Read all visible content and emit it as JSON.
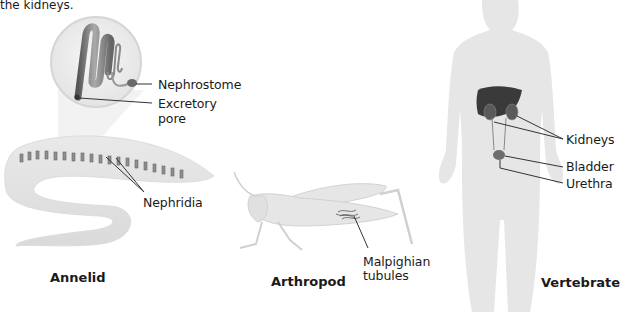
{
  "intro_text": "the kidneys.",
  "panels": {
    "annelid": {
      "caption": "Annelid",
      "labels": {
        "nephrostome": "Nephrostome",
        "excretory_pore_line1": "Excretory",
        "excretory_pore_line2": "pore",
        "nephridia": "Nephridia"
      }
    },
    "arthropod": {
      "caption": "Arthropod",
      "labels": {
        "malpighian_line1": "Malpighian",
        "malpighian_line2": "tubules"
      }
    },
    "vertebrate": {
      "caption": "Vertebrate",
      "labels": {
        "kidneys": "Kidneys",
        "bladder": "Bladder",
        "urethra": "Urethra"
      }
    }
  },
  "colors": {
    "body_fill": "#e6e6e6",
    "organ_dark": "#3a3a3a",
    "organ_mid": "#6e6e6e",
    "leader_line": "#333333"
  }
}
